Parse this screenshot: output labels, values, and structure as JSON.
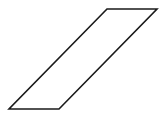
{
  "diagram": {
    "shape": "parallelogram",
    "stroke_color": "#1a1a1a",
    "fill_color": "#ffffff",
    "stroke_width": 1.6,
    "vertices": [
      {
        "x": 107,
        "y": 9
      },
      {
        "x": 157,
        "y": 9
      },
      {
        "x": 59,
        "y": 109
      },
      {
        "x": 9,
        "y": 109
      }
    ],
    "points": "107,9 157,9 59,109 9,109"
  },
  "watermark": {
    "text": ""
  }
}
